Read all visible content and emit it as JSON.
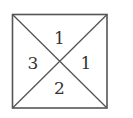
{
  "diagram": {
    "shape": "square divided by both diagonals into four triangles",
    "stroke_color": "#555555",
    "regions": {
      "top": "1",
      "right": "1",
      "bottom": "2",
      "left": "3"
    }
  }
}
